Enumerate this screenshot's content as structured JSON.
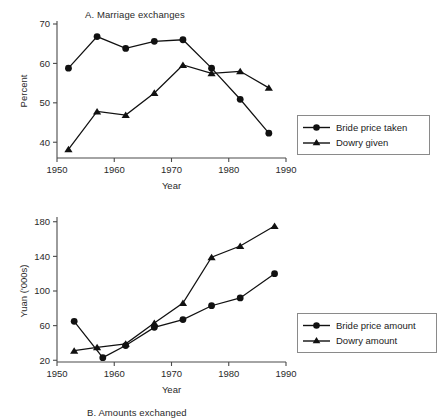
{
  "figure": {
    "background": "#ffffff",
    "line_color": "#111111",
    "axis_color": "#4a4a4a"
  },
  "panel_a": {
    "title": "A. Marriage exchanges",
    "legend": {
      "items": [
        {
          "label": "Bride price taken",
          "marker": "circle"
        },
        {
          "label": "Dowry given",
          "marker": "triangle"
        }
      ]
    }
  },
  "panel_b": {
    "title": "B. Amounts exchanged",
    "legend": {
      "items": [
        {
          "label": "Bride price amount",
          "marker": "circle"
        },
        {
          "label": "Dowry amount",
          "marker": "triangle"
        }
      ]
    }
  },
  "chart_data": [
    {
      "type": "line",
      "title": "A. Marriage exchanges",
      "xlabel": "Year",
      "ylabel": "Percent",
      "xlim": [
        1950,
        1990
      ],
      "ylim": [
        36,
        70
      ],
      "xticks": [
        1950,
        1960,
        1970,
        1980,
        1990
      ],
      "xticklabels": [
        "1950",
        "1960",
        "1970",
        "1980",
        "1990"
      ],
      "yticks": [
        40,
        50,
        60,
        70
      ],
      "yticklabels": [
        "40",
        "50",
        "60",
        "70"
      ],
      "grid": false,
      "legend_position": "right",
      "series": [
        {
          "name": "Bride price taken",
          "marker": "circle",
          "x": [
            1952,
            1957,
            1962,
            1967,
            1972,
            1977,
            1982,
            1987
          ],
          "values": [
            58.8,
            66.8,
            63.8,
            65.6,
            66.0,
            58.8,
            50.9,
            42.3
          ]
        },
        {
          "name": "Dowry given",
          "marker": "triangle",
          "x": [
            1952,
            1957,
            1962,
            1967,
            1972,
            1977,
            1982,
            1987
          ],
          "values": [
            38.2,
            47.8,
            46.9,
            52.5,
            59.6,
            57.5,
            58.0,
            53.8
          ]
        }
      ]
    },
    {
      "type": "line",
      "title": "B. Amounts exchanged",
      "xlabel": "Year",
      "ylabel": "Yuan ('000s)",
      "xlim": [
        1950,
        1990
      ],
      "ylim": [
        18,
        182
      ],
      "xticks": [
        1950,
        1960,
        1970,
        1980,
        1990
      ],
      "xticklabels": [
        "1950",
        "1960",
        "1970",
        "1980",
        "1990"
      ],
      "yticks": [
        20,
        60,
        100,
        140,
        180
      ],
      "yticklabels": [
        "20",
        "60",
        "100",
        "140",
        "180"
      ],
      "grid": false,
      "legend_position": "right",
      "series": [
        {
          "name": "Bride price amount",
          "marker": "circle",
          "x": [
            1953,
            1958,
            1962,
            1967,
            1972,
            1977,
            1982,
            1988
          ],
          "values": [
            65,
            23,
            37,
            58,
            67,
            83,
            92,
            120
          ]
        },
        {
          "name": "Dowry amount",
          "marker": "triangle",
          "x": [
            1953,
            1957,
            1962,
            1967,
            1972,
            1977,
            1982,
            1988
          ],
          "values": [
            31,
            35,
            39,
            63,
            86,
            139,
            152,
            175
          ]
        }
      ]
    }
  ]
}
